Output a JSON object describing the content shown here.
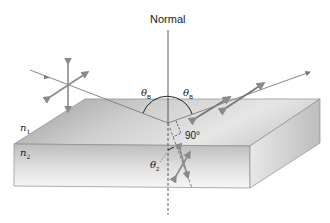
{
  "diagram": {
    "labels": {
      "normal": "Normal",
      "theta_symbol": "θ",
      "theta_b_sub": "B",
      "theta_2_sub": "2",
      "n_symbol": "n",
      "n1_sub": "1",
      "n2_sub": "2",
      "right_angle": "90°"
    },
    "colors": {
      "ray": "#6e6e6e",
      "polarization_arrow": "#8a8a8a",
      "slab_top_light": "#e8e8e8",
      "slab_top_dark": "#a4a4a4",
      "slab_edge": "#8c8c8c",
      "text": "#1a1a1a"
    },
    "elements": [
      {
        "id": "normal-line",
        "kind": "dashed-below-surface"
      },
      {
        "id": "incident-ray",
        "polarization": "unpolarized (two perpendicular double arrows)"
      },
      {
        "id": "reflected-ray",
        "polarization": "perpendicular to plane of incidence"
      },
      {
        "id": "refracted-ray",
        "polarization": "partially polarized"
      },
      {
        "id": "slab",
        "media": [
          "n1",
          "n2"
        ]
      }
    ]
  }
}
